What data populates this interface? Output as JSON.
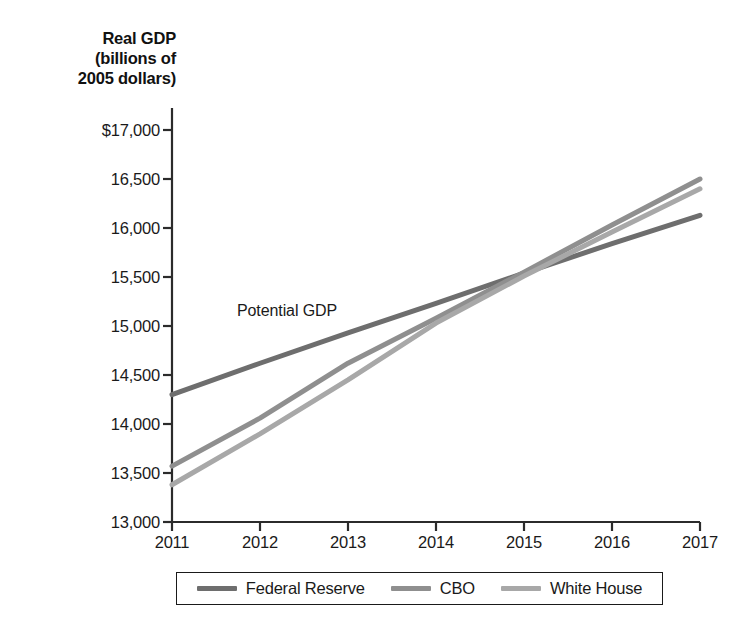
{
  "chart_data": {
    "type": "line",
    "title": "Real GDP (billions of 2005 dollars)",
    "title_lines": [
      "Real GDP",
      "(billions of",
      "2005 dollars)"
    ],
    "xlabel": "",
    "ylabel": "Real GDP (billions of 2005 dollars)",
    "x": [
      2011,
      2012,
      2013,
      2014,
      2015,
      2016,
      2017
    ],
    "xtick_labels": [
      "2011",
      "2012",
      "2013",
      "2014",
      "2015",
      "2016",
      "2017"
    ],
    "ytick_labels": [
      "$17,000",
      "16,500",
      "16,000",
      "15,500",
      "15,000",
      "14,500",
      "14,000",
      "13,500",
      "13,000"
    ],
    "ytick_values": [
      17000,
      16500,
      16000,
      15500,
      15000,
      14500,
      14000,
      13500,
      13000
    ],
    "xlim": [
      2011,
      2017
    ],
    "ylim": [
      13000,
      17000
    ],
    "grid": false,
    "legend_position": "bottom",
    "annotations": [
      {
        "text": "Potential GDP",
        "x": 2012.35,
        "y": 15080
      }
    ],
    "series": [
      {
        "name": "Federal Reserve",
        "color": "#6e6e6e",
        "values": [
          14300,
          14620,
          14930,
          15230,
          15540,
          15840,
          16130
        ]
      },
      {
        "name": "CBO",
        "color": "#8f8f8f",
        "values": [
          13570,
          14060,
          14620,
          15080,
          15550,
          16030,
          16500
        ]
      },
      {
        "name": "White House",
        "color": "#a8a8a8",
        "values": [
          13380,
          13900,
          14450,
          15030,
          15510,
          15960,
          16400
        ]
      }
    ]
  },
  "legend": {
    "items": [
      {
        "label": "Federal Reserve",
        "color": "#6e6e6e"
      },
      {
        "label": "CBO",
        "color": "#8f8f8f"
      },
      {
        "label": "White House",
        "color": "#a8a8a8"
      }
    ]
  },
  "axis": {
    "title_line1": "Real GDP",
    "title_line2": "(billions of",
    "title_line3": "2005 dollars)",
    "y_labels": {
      "t0": "$17,000",
      "t1": "16,500",
      "t2": "16,000",
      "t3": "15,500",
      "t4": "15,000",
      "t5": "14,500",
      "t6": "14,000",
      "t7": "13,500",
      "t8": "13,000"
    },
    "x_labels": {
      "t0": "2011",
      "t1": "2012",
      "t2": "2013",
      "t3": "2014",
      "t4": "2015",
      "t5": "2016",
      "t6": "2017"
    },
    "axis_color": "#2b2b2b"
  },
  "annotation": {
    "potential_gdp": "Potential GDP"
  }
}
